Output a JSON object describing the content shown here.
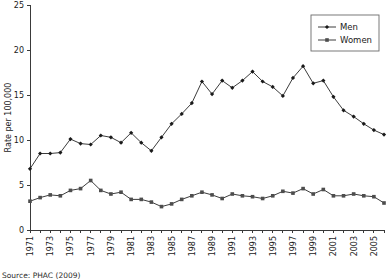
{
  "chart_data": {
    "type": "line",
    "title": "",
    "xlabel": "",
    "ylabel": "Rate per 100,000",
    "ylim": [
      0,
      25
    ],
    "yticks": [
      0,
      5,
      10,
      15,
      20,
      25
    ],
    "ytick_labels": [
      "0",
      "5",
      "10",
      "15",
      "20",
      "25"
    ],
    "grid": false,
    "legend_position": "top-right",
    "x": [
      1971,
      1972,
      1973,
      1974,
      1975,
      1976,
      1977,
      1978,
      1979,
      1980,
      1981,
      1982,
      1983,
      1984,
      1985,
      1986,
      1987,
      1988,
      1989,
      1990,
      1991,
      1992,
      1993,
      1994,
      1995,
      1996,
      1997,
      1998,
      1999,
      2000,
      2001,
      2002,
      2003,
      2004,
      2005,
      2006
    ],
    "xtick_labels": [
      "1971",
      "1973",
      "1975",
      "1977",
      "1979",
      "1981",
      "1983",
      "1985",
      "1987",
      "1989",
      "1991",
      "1993",
      "1995",
      "1997",
      "1999",
      "2001",
      "2003",
      "2005"
    ],
    "xtick_values": [
      1971,
      1973,
      1975,
      1977,
      1979,
      1981,
      1983,
      1985,
      1987,
      1989,
      1991,
      1993,
      1995,
      1997,
      1999,
      2001,
      2003,
      2005
    ],
    "series": [
      {
        "name": "Men",
        "marker": "diamond",
        "color": "#1a1a1a",
        "values": [
          6.8,
          8.5,
          8.5,
          8.6,
          10.1,
          9.6,
          9.5,
          10.5,
          10.3,
          9.7,
          10.8,
          9.7,
          8.8,
          10.3,
          11.8,
          12.9,
          14.1,
          16.5,
          15.1,
          16.6,
          15.8,
          16.6,
          17.6,
          16.5,
          15.9,
          14.9,
          16.9,
          18.2,
          16.3,
          16.6,
          14.8,
          13.3,
          12.6,
          11.8,
          11.1,
          10.6
        ]
      },
      {
        "name": "Women",
        "marker": "square",
        "color": "#4d4d4d",
        "values": [
          3.2,
          3.6,
          3.9,
          3.8,
          4.4,
          4.6,
          5.5,
          4.4,
          4.0,
          4.2,
          3.4,
          3.4,
          3.1,
          2.6,
          2.9,
          3.4,
          3.8,
          4.2,
          3.9,
          3.5,
          4.0,
          3.8,
          3.7,
          3.5,
          3.8,
          4.3,
          4.1,
          4.6,
          4.0,
          4.5,
          3.8,
          3.8,
          4.0,
          3.8,
          3.7,
          3.0
        ]
      }
    ]
  },
  "legend": {
    "entries": [
      "Men",
      "Women"
    ]
  },
  "footer": {
    "source": "Source: PHAC (2009)"
  }
}
